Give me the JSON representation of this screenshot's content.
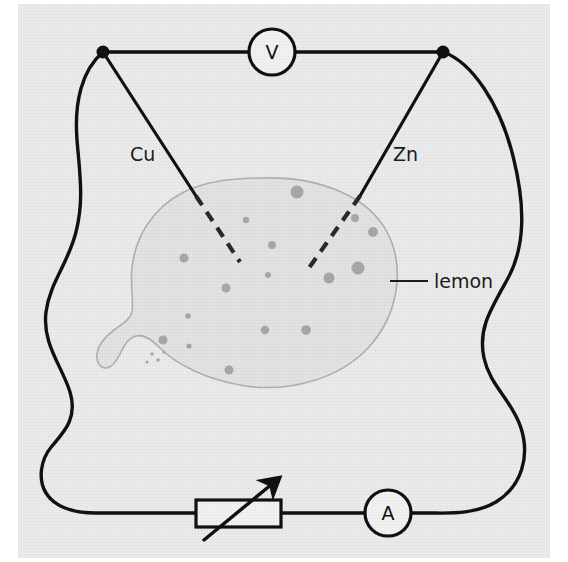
{
  "figure": {
    "type": "circuit-schematic"
  },
  "colors": {
    "page_background": "#ffffff",
    "panel_background": "#ebebeb",
    "wire": "#111111",
    "lemon_fill": "#e3e3e3",
    "lemon_outline": "#b0b0b0",
    "lemon_spot": "#a8a8a8",
    "text": "#1c1c1c",
    "meter_fill": "#f2f2f2"
  },
  "labels": {
    "copper_electrode": "Cu",
    "zinc_electrode": "Zn",
    "lemon": "lemon",
    "voltmeter": "V",
    "ammeter": "A"
  },
  "components": [
    {
      "name": "voltmeter",
      "symbol": "V",
      "shape": "circle",
      "cx": 272,
      "cy": 52,
      "r": 23
    },
    {
      "name": "ammeter",
      "symbol": "A",
      "shape": "circle",
      "cx": 388,
      "cy": 513,
      "r": 23
    },
    {
      "name": "variable-resistor",
      "symbol": "",
      "shape": "rect-with-arrow",
      "x": 196,
      "y": 500,
      "w": 85,
      "h": 27
    },
    {
      "name": "left-terminal-node",
      "symbol": "",
      "shape": "dot",
      "cx": 103,
      "cy": 52,
      "r": 6
    },
    {
      "name": "right-terminal-node",
      "symbol": "",
      "shape": "dot",
      "cx": 443,
      "cy": 52,
      "r": 6
    }
  ],
  "lemon_spots": [
    {
      "cx": 297,
      "cy": 192,
      "r": 6.5
    },
    {
      "cx": 246,
      "cy": 220,
      "r": 3.2
    },
    {
      "cx": 272,
      "cy": 245,
      "r": 4.0
    },
    {
      "cx": 355,
      "cy": 218,
      "r": 4.0
    },
    {
      "cx": 373,
      "cy": 232,
      "r": 5.0
    },
    {
      "cx": 184,
      "cy": 258,
      "r": 4.5
    },
    {
      "cx": 268,
      "cy": 275,
      "r": 3.0
    },
    {
      "cx": 329,
      "cy": 278,
      "r": 5.5
    },
    {
      "cx": 358,
      "cy": 268,
      "r": 6.5
    },
    {
      "cx": 226,
      "cy": 288,
      "r": 4.5
    },
    {
      "cx": 188,
      "cy": 316,
      "r": 2.8
    },
    {
      "cx": 265,
      "cy": 330,
      "r": 4.2
    },
    {
      "cx": 306,
      "cy": 330,
      "r": 4.8
    },
    {
      "cx": 163,
      "cy": 340,
      "r": 4.5
    },
    {
      "cx": 189,
      "cy": 346,
      "r": 2.6
    },
    {
      "cx": 229,
      "cy": 370,
      "r": 4.5
    },
    {
      "cx": 152,
      "cy": 354,
      "r": 1.8
    },
    {
      "cx": 158,
      "cy": 360,
      "r": 1.8
    },
    {
      "cx": 147,
      "cy": 362,
      "r": 1.6
    },
    {
      "cx": 164,
      "cy": 352,
      "r": 1.6
    }
  ],
  "electrodes": [
    {
      "name": "copper",
      "label": "Cu",
      "solid_from": [
        103,
        52
      ],
      "solid_to": [
        196,
        196
      ],
      "dash_to": [
        240,
        262
      ]
    },
    {
      "name": "zinc",
      "label": "Zn",
      "solid_from": [
        443,
        52
      ],
      "solid_to": [
        360,
        196
      ],
      "dash_to": [
        306,
        272
      ]
    }
  ],
  "annotations": [
    {
      "name": "lemon-callout",
      "text": "lemon",
      "leader_from": [
        390,
        281
      ],
      "leader_to": [
        428,
        281
      ],
      "text_x": 434,
      "text_y": 288
    }
  ]
}
